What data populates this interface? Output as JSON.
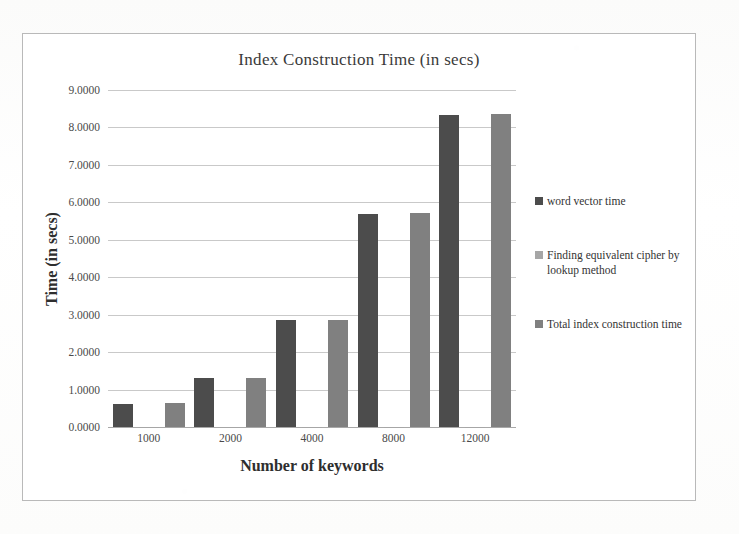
{
  "chart_data": {
    "type": "bar",
    "title": "Index  Construction Time (in secs)",
    "xlabel": "Number of keywords",
    "ylabel": "Time (in secs)",
    "categories": [
      "1000",
      "2000",
      "4000",
      "8000",
      "12000"
    ],
    "ylim": [
      0,
      9
    ],
    "ytick_labels": [
      "0.0000",
      "1.0000",
      "2.0000",
      "3.0000",
      "4.0000",
      "5.0000",
      "6.0000",
      "7.0000",
      "8.0000",
      "9.0000"
    ],
    "ytick_values": [
      0,
      1,
      2,
      3,
      4,
      5,
      6,
      7,
      8,
      9
    ],
    "grid": true,
    "legend_position": "right",
    "series": [
      {
        "name": "word vector time",
        "color": "#4c4c4c",
        "values": [
          0.62,
          1.3,
          2.85,
          5.7,
          8.32
        ]
      },
      {
        "name": "Finding equivalent cipher by lookup method",
        "color": "#a6a6a6",
        "values": [
          0.004,
          0.005,
          0.006,
          0.007,
          0.009
        ]
      },
      {
        "name": "Total index construction time",
        "color": "#808080",
        "values": [
          0.63,
          1.31,
          2.86,
          5.71,
          8.36
        ]
      }
    ]
  },
  "colors": {
    "series1": "#4c4c4c",
    "series2": "#a6a6a6",
    "series3": "#808080",
    "gridline": "#c9c9c9",
    "frame_border": "#b9b9b9",
    "text": "#333333"
  }
}
